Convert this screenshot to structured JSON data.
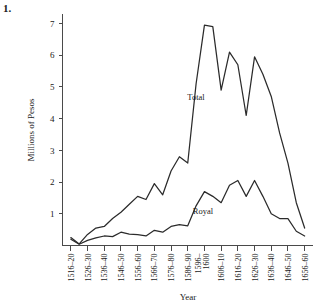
{
  "figure": {
    "number_label": "1."
  },
  "chart_data": {
    "type": "line",
    "title": "",
    "xlabel": "Year",
    "ylabel": "Millions of Pesos",
    "ylim": [
      0,
      7.3
    ],
    "yticks": [
      1,
      2,
      3,
      4,
      5,
      6,
      7
    ],
    "ytick_labels": [
      "1",
      "2",
      "3",
      "4",
      "5",
      "6",
      "7"
    ],
    "grid": false,
    "legend_position": "inline-annotation",
    "categories": [
      "1516–20",
      "1526–30",
      "1536–40",
      "1546–50",
      "1556–60",
      "1566–70",
      "1576–80",
      "1586–90",
      "1596–1600",
      "1606–10",
      "1616–20",
      "1626–30",
      "1636–40",
      "1646–50",
      "1656–60"
    ],
    "xtick_labels": [
      "1516–20",
      "1526–30",
      "1536–40",
      "1546–50",
      "1556–60",
      "1566–70",
      "1576–80",
      "1586–90",
      "1596–1600",
      "1606–10",
      "1616–20",
      "1626–30",
      "1636–40",
      "1646–50",
      "1656–60"
    ],
    "series": [
      {
        "name": "Total",
        "label": "Total",
        "x": [
          "1516–20",
          "1521–25",
          "1526–30",
          "1531–35",
          "1536–40",
          "1541–45",
          "1546–50",
          "1551–55",
          "1556–60",
          "1561–65",
          "1566–70",
          "1571–75",
          "1576–80",
          "1581–85",
          "1586–90",
          "1591–95",
          "1596–1600",
          "1601–05",
          "1606–10",
          "1611–15",
          "1616–20",
          "1621–25",
          "1626–30",
          "1631–35",
          "1636–40",
          "1641–45",
          "1646–50",
          "1651–55",
          "1656–60"
        ],
        "values": [
          0.25,
          0.05,
          0.35,
          0.55,
          0.6,
          0.85,
          1.05,
          1.3,
          1.55,
          1.45,
          1.95,
          1.6,
          2.35,
          2.8,
          2.6,
          5.1,
          6.95,
          6.9,
          4.9,
          6.1,
          5.7,
          4.1,
          5.95,
          5.4,
          4.7,
          3.55,
          2.6,
          1.35,
          0.55
        ]
      },
      {
        "name": "Royal",
        "label": "Royal",
        "x": [
          "1516–20",
          "1521–25",
          "1526–30",
          "1531–35",
          "1536–40",
          "1541–45",
          "1546–50",
          "1551–55",
          "1556–60",
          "1561–65",
          "1566–70",
          "1571–75",
          "1576–80",
          "1581–85",
          "1586–90",
          "1591–95",
          "1596–1600",
          "1601–05",
          "1606–10",
          "1611–15",
          "1616–20",
          "1621–25",
          "1626–30",
          "1631–35",
          "1636–40",
          "1641–45",
          "1646–50",
          "1651–55",
          "1656–60"
        ],
        "values": [
          0.2,
          0.04,
          0.16,
          0.24,
          0.3,
          0.28,
          0.42,
          0.36,
          0.34,
          0.3,
          0.48,
          0.42,
          0.6,
          0.66,
          0.62,
          1.25,
          1.7,
          1.55,
          1.35,
          1.9,
          2.05,
          1.55,
          2.05,
          1.55,
          1.0,
          0.85,
          0.85,
          0.45,
          0.3
        ]
      }
    ],
    "annotations": [
      {
        "text": "Total",
        "series": "Total"
      },
      {
        "text": "Royal",
        "series": "Royal"
      }
    ]
  }
}
